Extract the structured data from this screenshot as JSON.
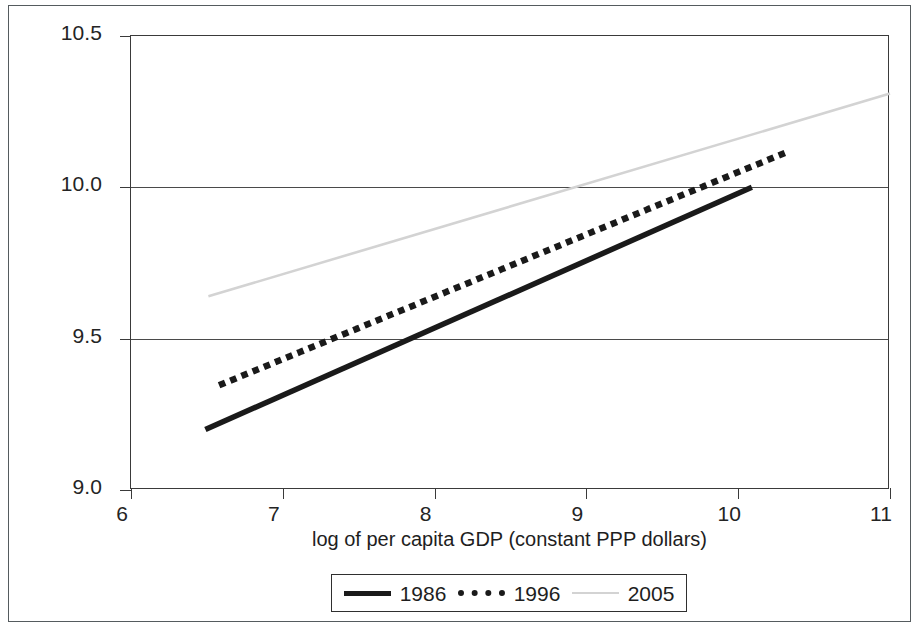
{
  "chart_data": {
    "type": "line",
    "title": "",
    "xlabel": "log of per capita GDP (constant PPP dollars)",
    "ylabel": "uphill flows of sophisticated exports",
    "xlim": [
      6,
      11
    ],
    "ylim": [
      9.0,
      10.5
    ],
    "xticks": [
      "6",
      "7",
      "8",
      "9",
      "10",
      "11"
    ],
    "yticks": [
      "10.5",
      "10.0",
      "9.5",
      "9.0"
    ],
    "ytick_values": [
      10.5,
      10.0,
      9.5,
      9.0
    ],
    "xtick_values": [
      6,
      7,
      8,
      9,
      10,
      11
    ],
    "grid": "horizontal",
    "legend_position": "below-axis-center",
    "series": [
      {
        "name": "1986",
        "style": "solid",
        "color": "#1a1a1a",
        "points": [
          [
            6.49,
            9.2
          ],
          [
            10.09,
            10.0
          ]
        ]
      },
      {
        "name": "1996",
        "style": "dotted",
        "color": "#1a1a1a",
        "points": [
          [
            6.6,
            9.35
          ],
          [
            10.29,
            10.11
          ]
        ]
      },
      {
        "name": "2005",
        "style": "solid-light",
        "color": "#d3d3d3",
        "points": [
          [
            6.51,
            9.64
          ],
          [
            11.0,
            10.31
          ]
        ]
      }
    ]
  },
  "legend": {
    "items": [
      {
        "label": "1986",
        "swatch": "solid-line-swatch"
      },
      {
        "label": "1996",
        "swatch": "dotted-line-swatch"
      },
      {
        "label": "2005",
        "swatch": "light-line-swatch"
      }
    ]
  }
}
